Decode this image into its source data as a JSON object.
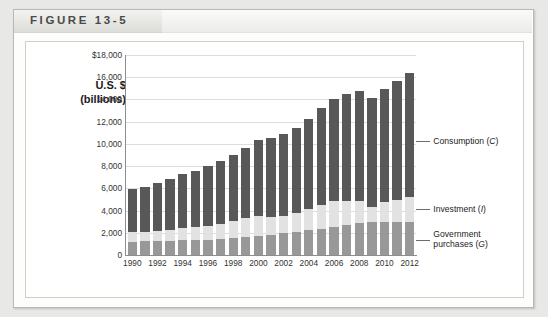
{
  "figure": {
    "label": "FIGURE 13-5"
  },
  "axis": {
    "title_line1": "U.S. $",
    "title_line2": "(billions)"
  },
  "callouts": [
    {
      "name": "consumption",
      "line1": "Consumption (",
      "sym": "C",
      "line1b": ")"
    },
    {
      "name": "investment",
      "line1": "Investment (",
      "sym": "I",
      "line1b": ")"
    },
    {
      "name": "government",
      "line1": "Government",
      "line2": "purchases (",
      "sym": "G",
      "line2b": ")"
    }
  ],
  "chart_data": {
    "type": "bar",
    "stacked": true,
    "title": "FIGURE 13-5",
    "xlabel": "",
    "ylabel": "U.S. $ (billions)",
    "ylim": [
      0,
      18000
    ],
    "ytick_values": [
      0,
      2000,
      4000,
      6000,
      8000,
      10000,
      12000,
      14000,
      16000,
      18000
    ],
    "ytick_labels": [
      "0",
      "2,000",
      "4,000",
      "6,000",
      "8,000",
      "10,000",
      "12,000",
      "14,000",
      "16,000",
      "$18,000"
    ],
    "grid": true,
    "legend_position": "right-annotations",
    "categories": [
      1990,
      1991,
      1992,
      1993,
      1994,
      1995,
      1996,
      1997,
      1998,
      1999,
      2000,
      2001,
      2002,
      2003,
      2004,
      2005,
      2006,
      2007,
      2008,
      2009,
      2010,
      2011,
      2012
    ],
    "xtick_labels": [
      "1990",
      "1992",
      "1994",
      "1996",
      "1998",
      "2000",
      "2002",
      "2004",
      "2006",
      "2008",
      "2010",
      "2012"
    ],
    "colors": {
      "consumption": "#585858",
      "investment": "#e2e2e2",
      "government": "#989898",
      "gridline": "#dddddd",
      "axis": "#8d8d8d"
    },
    "series": [
      {
        "name": "Government purchases (G)",
        "key": "government",
        "values": [
          1180,
          1230,
          1270,
          1290,
          1310,
          1350,
          1390,
          1440,
          1500,
          1600,
          1720,
          1830,
          1960,
          2090,
          2210,
          2360,
          2510,
          2670,
          2880,
          2970,
          3000,
          2990,
          3010
        ]
      },
      {
        "name": "Investment (I)",
        "key": "investment",
        "values": [
          860,
          800,
          870,
          950,
          1100,
          1150,
          1250,
          1390,
          1540,
          1690,
          1810,
          1630,
          1570,
          1670,
          1890,
          2160,
          2330,
          2230,
          1990,
          1390,
          1760,
          1990,
          2240
        ]
      },
      {
        "name": "Consumption (C)",
        "key": "consumption",
        "values": [
          3940,
          4120,
          4330,
          4580,
          4840,
          5070,
          5350,
          5610,
          5950,
          6340,
          6790,
          7050,
          7350,
          7710,
          8170,
          8680,
          9180,
          9600,
          9900,
          9800,
          10200,
          10700,
          11150
        ]
      }
    ],
    "totals": [
      5980,
      6150,
      6470,
      6820,
      7250,
      7570,
      7990,
      8440,
      8990,
      9630,
      10320,
      10510,
      10880,
      11470,
      12270,
      13200,
      14020,
      14500,
      14770,
      14160,
      14960,
      15680,
      16400
    ]
  }
}
